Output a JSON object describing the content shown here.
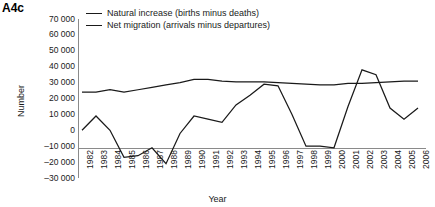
{
  "panel_label": "A4c",
  "legend": {
    "position": "top-center",
    "entries": [
      {
        "label": "Natural increase (births minus deaths)",
        "color": "#1a1a1a"
      },
      {
        "label": "Net migration (arrivals minus departures)",
        "color": "#1a1a1a"
      }
    ]
  },
  "axes": {
    "ylabel": "Number",
    "xlabel": "Year",
    "yticks": [
      "70 000",
      "60 000",
      "50 000",
      "40 000",
      "30 000",
      "20 000",
      "10 000",
      "0",
      "–10 000",
      "–20 000",
      "–30 000"
    ]
  },
  "chart_data": {
    "type": "line",
    "title": "A4c",
    "xlabel": "Year",
    "ylabel": "Number",
    "ylim": [
      -30000,
      70000
    ],
    "ytick_values": [
      70000,
      60000,
      50000,
      40000,
      30000,
      20000,
      10000,
      0,
      -10000,
      -20000,
      -30000
    ],
    "grid": false,
    "legend_position": "top-center",
    "categories": [
      "1982",
      "1983",
      "1984",
      "1985",
      "1986",
      "1987",
      "1988",
      "1989",
      "1990",
      "1991",
      "1992",
      "1993",
      "1994",
      "1995",
      "1996",
      "1997",
      "1998",
      "1999",
      "2000",
      "2001",
      "2002",
      "2003",
      "2004",
      "2005",
      "2006"
    ],
    "series": [
      {
        "name": "Natural increase (births minus deaths)",
        "color": "#1a1a1a",
        "values": [
          24000,
          24000,
          25500,
          24000,
          25500,
          27000,
          28500,
          30000,
          32000,
          32000,
          31000,
          30500,
          30500,
          30500,
          30000,
          29500,
          29000,
          28500,
          28500,
          29500,
          29500,
          30000,
          30500,
          31000,
          31000
        ]
      },
      {
        "name": "Net migration (arrivals minus departures)",
        "color": "#1a1a1a",
        "values": [
          0,
          9000,
          0,
          -17000,
          -16000,
          -11000,
          -21000,
          -2000,
          9000,
          7000,
          5000,
          16000,
          22000,
          29000,
          28000,
          10000,
          -10000,
          -10000,
          -11000,
          15000,
          38000,
          35000,
          14000,
          7000,
          14000
        ]
      }
    ]
  }
}
